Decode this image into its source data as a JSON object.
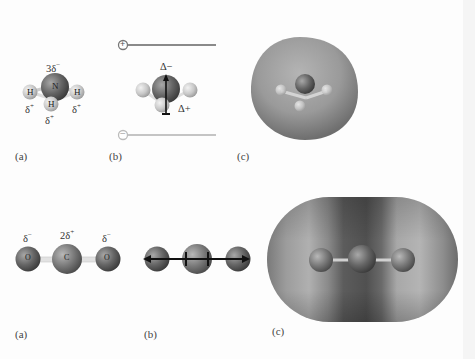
{
  "figure_top": {
    "molecule": "NH3",
    "panel_a": {
      "label": "(a)",
      "atoms": {
        "central": "N",
        "h1": "H",
        "h2": "H",
        "h3": "H"
      },
      "charges": {
        "central": "3δ",
        "central_sign": "−",
        "h_left": "δ",
        "h_left_sign": "+",
        "h_right": "δ",
        "h_right_sign": "+",
        "h_bottom": "δ",
        "h_bottom_sign": "+"
      }
    },
    "panel_b": {
      "label": "(b)",
      "plate_top_sign": "+",
      "plate_bottom_sign": "−",
      "dipole_top": "Δ−",
      "dipole_bottom": "Δ+"
    },
    "panel_c": {
      "label": "(c)",
      "description": "electrostatic potential surface"
    }
  },
  "figure_bottom": {
    "molecule": "CO2",
    "panel_a": {
      "label": "(a)",
      "atoms": {
        "left": "O",
        "center": "C",
        "right": "O"
      },
      "charges": {
        "left": "δ",
        "left_sign": "−",
        "center": "2δ",
        "center_sign": "+",
        "right": "δ",
        "right_sign": "−"
      }
    },
    "panel_b": {
      "label": "(b)",
      "description": "opposing bond dipole arrows"
    },
    "panel_c": {
      "label": "(c)",
      "description": "electrostatic potential surface"
    }
  },
  "colors": {
    "atom_dark": "#5a5a5a",
    "atom_light": "#c8c8c8",
    "plate_top": "#8a8a8a",
    "plate_bottom": "#c4c4c4",
    "arrow": "#111111"
  }
}
